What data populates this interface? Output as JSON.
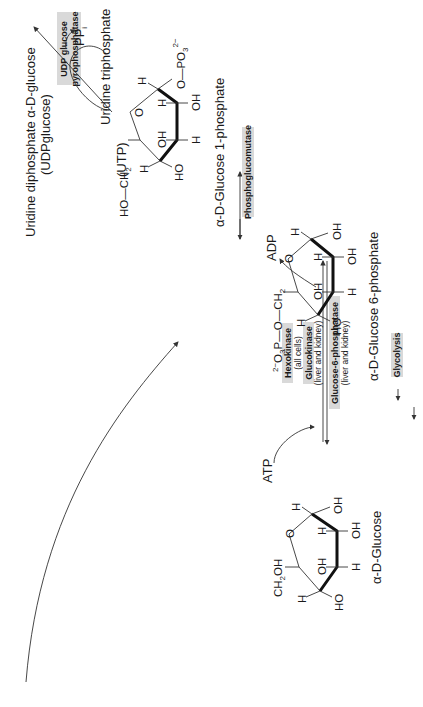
{
  "diagram": {
    "orientation": "rotated -90 degrees",
    "compounds": [
      {
        "id": "glucose",
        "label": "α-D-Glucose",
        "substituents": [
          "CH2OH",
          "O",
          "H",
          "OH",
          "H",
          "OH",
          "OH",
          "H",
          "HO",
          "H"
        ]
      },
      {
        "id": "g6p",
        "label": "α-D-Glucose 6-phosphate",
        "substituents": [
          "2−O3P—O—CH2",
          "O",
          "H",
          "OH",
          "H",
          "OH",
          "OH",
          "H",
          "HO",
          "H"
        ]
      },
      {
        "id": "g1p",
        "label": "α-D-Glucose 1-phosphate",
        "substituents": [
          "HO—CH2",
          "O",
          "H",
          "O—PO3 2−",
          "H",
          "OH",
          "OH",
          "H",
          "HO",
          "H"
        ]
      },
      {
        "id": "udpg",
        "label": "Uridine diphosphate α-D-glucose",
        "sublabel": "(UDPglucose)"
      }
    ],
    "cofactors": {
      "atp": "ATP",
      "adp": "ADP",
      "utp": "Uridine triphosphate",
      "utp_abbr": "(UTP)",
      "ppi": "PP",
      "ppi_sub": "i"
    },
    "enzymes": {
      "hexokinase": "Hexokinase",
      "hexokinase_note": "(all cells)",
      "glucokinase": "Glucokinase",
      "glucokinase_note": "(liver and kidney)",
      "g6pase": "Glucose-6-phosphatase",
      "g6pase_note": "(liver and kidney)",
      "pgm": "Phosphoglucomutase",
      "udpgpp_line1": "UDP glucose",
      "udpgpp_line2": "pyrophosphatase",
      "glycolysis": "Glycolysis"
    },
    "atoms": {
      "ch2oh": "CH",
      "ch2oh_sub": "2",
      "ch2oh_tail": "OH",
      "o": "O",
      "h": "H",
      "oh": "OH",
      "ho": "HO",
      "g6p_prefix": "2−",
      "g6p_o3": "O",
      "g6p_o3_sub": "3",
      "g6p_p": "P—O—CH",
      "g6p_ch2_sub": "2",
      "g1p_hoch2": "HO—CH",
      "g1p_ch2_sub": "2",
      "g1p_opo3": "O—PO",
      "g1p_opo3_sub": "3",
      "g1p_charge": "2−"
    }
  }
}
